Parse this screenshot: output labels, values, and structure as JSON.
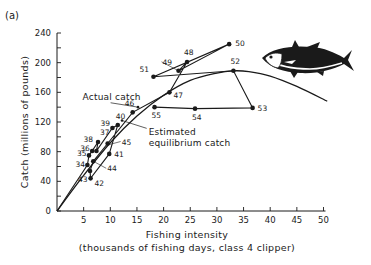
{
  "chart_data": {
    "type": "line",
    "panel_label": "(a)",
    "title": "",
    "xlabel": "Fishing intensity",
    "xlabel_sub": "(thousands of fishing days, class 4 clipper)",
    "ylabel": "Catch (millions of pounds)",
    "xlim": [
      0,
      50
    ],
    "ylim": [
      0,
      240
    ],
    "xticks": [
      5,
      10,
      15,
      20,
      25,
      30,
      35,
      40,
      45,
      50
    ],
    "yticks": [
      0,
      40,
      80,
      120,
      160,
      200,
      240
    ],
    "yminor_step": 20,
    "grid": false,
    "legend": "none",
    "series": [
      {
        "name": "Actual catch",
        "kind": "connected-scatter",
        "points": [
          {
            "label": "34",
            "x": 5.7,
            "y": 62
          },
          {
            "label": "35",
            "x": 6.0,
            "y": 75
          },
          {
            "label": "36",
            "x": 6.6,
            "y": 81
          },
          {
            "label": "37",
            "x": 7.7,
            "y": 93
          },
          {
            "label": "38",
            "x": 7.4,
            "y": 81
          },
          {
            "label": "39",
            "x": 10.4,
            "y": 112
          },
          {
            "label": "40",
            "x": 11.4,
            "y": 116
          },
          {
            "label": "41",
            "x": 9.8,
            "y": 77
          },
          {
            "label": "42",
            "x": 6.3,
            "y": 44
          },
          {
            "label": "43",
            "x": 6.2,
            "y": 54
          },
          {
            "label": "44",
            "x": 6.8,
            "y": 67
          },
          {
            "label": "45",
            "x": 9.5,
            "y": 91
          },
          {
            "label": "46",
            "x": 14.2,
            "y": 133
          },
          {
            "label": "47",
            "x": 21.1,
            "y": 160
          },
          {
            "label": "48",
            "x": 24.4,
            "y": 201
          },
          {
            "label": "49",
            "x": 22.8,
            "y": 189
          },
          {
            "label": "50",
            "x": 32.3,
            "y": 225
          },
          {
            "label": "51",
            "x": 18.1,
            "y": 181
          },
          {
            "label": "52",
            "x": 33.1,
            "y": 189
          },
          {
            "label": "53",
            "x": 36.7,
            "y": 139
          },
          {
            "label": "54",
            "x": 25.9,
            "y": 138
          },
          {
            "label": "55",
            "x": 18.3,
            "y": 140
          }
        ]
      },
      {
        "name": "Estimated equilibrium catch",
        "kind": "curve",
        "points": [
          {
            "x": 0,
            "y": 0
          },
          {
            "x": 5,
            "y": 48
          },
          {
            "x": 10,
            "y": 92
          },
          {
            "x": 15,
            "y": 128
          },
          {
            "x": 20,
            "y": 156
          },
          {
            "x": 25,
            "y": 176
          },
          {
            "x": 30,
            "y": 186
          },
          {
            "x": 33,
            "y": 189
          },
          {
            "x": 36,
            "y": 188
          },
          {
            "x": 40,
            "y": 182
          },
          {
            "x": 45,
            "y": 168
          },
          {
            "x": 50.7,
            "y": 148
          }
        ]
      }
    ],
    "annotations": [
      {
        "text": "Actual catch",
        "x": 4.8,
        "y": 150,
        "target_x": 15.2,
        "target_y": 140
      },
      {
        "text": "Estimated",
        "x": 17.2,
        "y": 102,
        "target_x": 12.2,
        "target_y": 122
      },
      {
        "text": "equilibrium catch",
        "x": 17.2,
        "y": 88
      }
    ],
    "illustration": "tuna-fish"
  }
}
